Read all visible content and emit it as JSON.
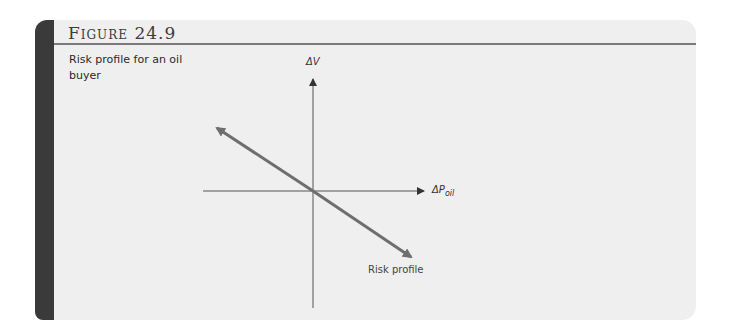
{
  "figure": {
    "title": "Figure 24.9",
    "caption": "Risk profile for an oil buyer"
  },
  "diagram": {
    "y_axis_label": "ΔV",
    "x_axis_label_main": "ΔP",
    "x_axis_label_sub": "oil",
    "line_label": "Risk profile",
    "line_color": "#6e6e6e",
    "axis_color": "#555555"
  }
}
